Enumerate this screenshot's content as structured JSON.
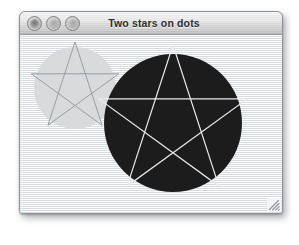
{
  "window": {
    "title": "Two stars on dots",
    "controls": [
      {
        "name": "close",
        "label": "Close"
      },
      {
        "name": "minimize",
        "label": "Minimize"
      },
      {
        "name": "zoom",
        "label": "Zoom"
      }
    ],
    "resize_grip_label": "Resize"
  },
  "canvas": {
    "background_color": "#eef0f2",
    "shapes": [
      {
        "id": "small-dot",
        "kind": "circle",
        "fill": "#d8dadb",
        "cx": 55,
        "cy": 53,
        "r": 41
      },
      {
        "id": "small-star",
        "kind": "pentagram",
        "stroke": "#9a9ea2",
        "stroke_width": 1,
        "cx": 55,
        "cy": 53,
        "r": 46,
        "rotation_deg": -90
      },
      {
        "id": "large-dot",
        "kind": "circle",
        "fill": "#1d1c1c",
        "cx": 153,
        "cy": 88,
        "r": 69
      },
      {
        "id": "large-star",
        "kind": "pentagram",
        "stroke": "#e9eaec",
        "stroke_width": 1.2,
        "cx": 153,
        "cy": 88,
        "r": 78,
        "rotation_deg": -90
      }
    ]
  }
}
